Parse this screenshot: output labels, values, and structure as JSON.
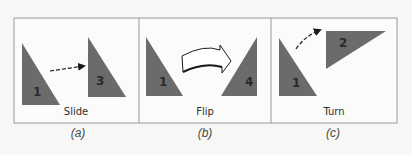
{
  "figure": {
    "colors": {
      "background": "#f7f7f5",
      "panel_fill": "#fbfbfa",
      "border": "#9a9a9a",
      "triangle_fill": "#6b6b6b",
      "triangle_label": "#2a2a2a",
      "arrow": "#1a1a1a",
      "text": "#2e2e2e"
    },
    "panels": [
      {
        "id": "a",
        "transformation": "Slide",
        "caption": "(a)",
        "shapes": [
          {
            "label": "1",
            "role": "original"
          },
          {
            "label": "3",
            "role": "result"
          }
        ],
        "arrow": "dashed-straight-arrow"
      },
      {
        "id": "b",
        "transformation": "Flip",
        "caption": "(b)",
        "shapes": [
          {
            "label": "1",
            "role": "original"
          },
          {
            "label": "4",
            "role": "result"
          }
        ],
        "arrow": "curved-block-arrow"
      },
      {
        "id": "c",
        "transformation": "Turn",
        "caption": "(c)",
        "shapes": [
          {
            "label": "1",
            "role": "original"
          },
          {
            "label": "2",
            "role": "result"
          }
        ],
        "arrow": "dashed-curved-arrow"
      }
    ]
  }
}
